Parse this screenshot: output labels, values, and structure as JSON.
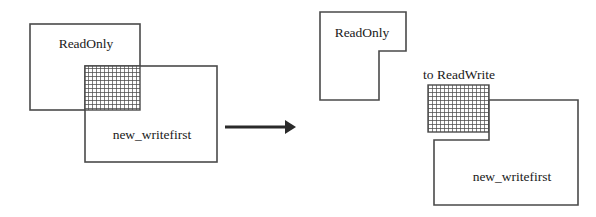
{
  "diagram": {
    "type": "region-transition-diagram",
    "colors": {
      "background": "#ffffff",
      "outline": "#4a4a4a",
      "hatch": "#4a4a4a",
      "arrow": "#2a2a2a",
      "text": "#1a1a1a"
    },
    "left_panel": {
      "name": "before",
      "readonly_box": {
        "label": "ReadOnly",
        "x": 30,
        "y": 24,
        "width": 110,
        "height": 86,
        "label_x": 86,
        "label_y": 45
      },
      "writefirst_box": {
        "label": "new_writefirst",
        "x": 85,
        "y": 66,
        "width": 132,
        "height": 96,
        "label_x": 152,
        "label_y": 136
      },
      "overlap_region": {
        "label": "",
        "x": 85,
        "y": 66,
        "width": 55,
        "height": 44,
        "fill": "cross-hatch"
      }
    },
    "arrow": {
      "label": "",
      "x1": 225,
      "y1": 127,
      "x2": 292,
      "y2": 127,
      "direction": "right"
    },
    "right_panel": {
      "name": "after",
      "readonly_shape": {
        "label": "ReadOnly",
        "points": "320,12 406,12 406,51 379,51 379,100 320,100",
        "label_x": 362,
        "label_y": 34
      },
      "converted_region": {
        "label": "to ReadWrite",
        "x": 428,
        "y": 85,
        "width": 61,
        "height": 47,
        "fill": "cross-hatch",
        "label_x": 459,
        "label_y": 76
      },
      "writefirst_shape": {
        "label": "new_writefirst",
        "points": "489,100 578,100 578,205 434,205 434,140 489,140",
        "label_x": 512,
        "label_y": 178
      }
    },
    "hatch": {
      "cell_size": 4,
      "line_width": 1.4
    }
  }
}
